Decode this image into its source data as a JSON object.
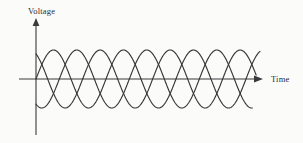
{
  "figure": {
    "kind": "three-phase-sine-waveform-diagram",
    "background_color": "#fbfbfa",
    "line_color": "#363638",
    "axis_color": "#3a3a3c"
  },
  "axes": {
    "y_axis": {
      "label": "Voltage",
      "orientation": "vertical",
      "arrow": "up",
      "tick_labels": [],
      "origin_px": {
        "x": 36,
        "y": 79
      },
      "top_px": 19,
      "bottom_px": 135
    },
    "x_axis": {
      "label": "Time",
      "orientation": "horizontal",
      "arrow": "right",
      "tick_labels": [],
      "left_px": 19,
      "right_px": 263
    }
  },
  "chart_data": {
    "type": "line",
    "title": "",
    "subtitle": "",
    "xlabel": "Time",
    "ylabel": "Voltage",
    "grid": false,
    "legend": false,
    "legend_position": "none",
    "xlim": [
      0,
      3.35
    ],
    "ylim": [
      -1.2,
      1.2
    ],
    "x_tick_labels": [],
    "y_tick_labels": [],
    "waveform": {
      "shape": "sine",
      "amplitude": 1.0,
      "period_cycles_shown": 3.2,
      "phase_offsets_degrees": [
        0,
        120,
        240
      ],
      "phase_count": 3
    },
    "series": [
      {
        "name": "Phase A",
        "phase_degrees": 0,
        "amplitude": 1.0,
        "start_value": 0.0,
        "start_direction": "rising"
      },
      {
        "name": "Phase B",
        "phase_degrees": 120,
        "amplitude": 1.0,
        "start_value": 0.866,
        "start_direction": "falling"
      },
      {
        "name": "Phase C",
        "phase_degrees": 240,
        "amplitude": 1.0,
        "start_value": -0.866,
        "start_direction": "rising"
      }
    ]
  }
}
